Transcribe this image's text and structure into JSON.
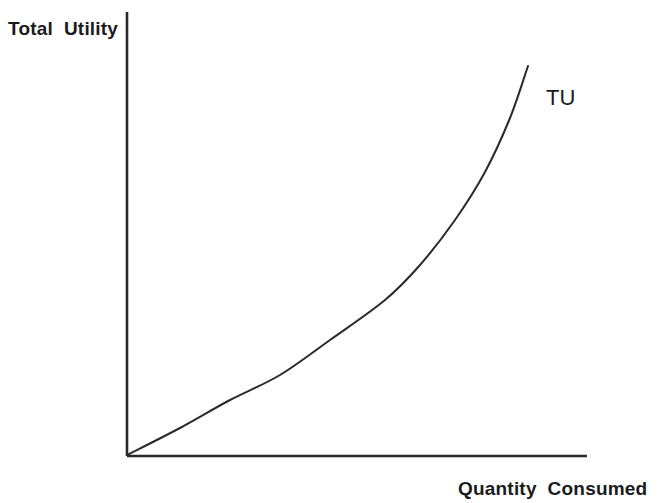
{
  "figure": {
    "background_color": "#ffffff",
    "ink_color": "#2a2a2a"
  },
  "labels": {
    "y_axis": "Total  Utility",
    "x_axis": "Quantity  Consumed",
    "curve": "TU"
  },
  "chart_data": {
    "type": "line",
    "title": "",
    "subtitle": "",
    "xlabel": "Quantity  Consumed",
    "ylabel": "Total  Utility",
    "grid": false,
    "legend": false,
    "legend_position": "inline-right-of-curve",
    "annotations": [
      {
        "text": "TU",
        "x_px": 546,
        "y_px": 87,
        "meaning": "Total Utility curve label"
      }
    ],
    "axes": {
      "x_axis_line_px": {
        "x1": 127,
        "y1": 456,
        "x2": 587,
        "y2": 456
      },
      "y_axis_line_px": {
        "x1": 127,
        "y1": 12,
        "x2": 127,
        "y2": 456
      },
      "origin_px": {
        "x": 127,
        "y": 456
      },
      "ticks_x": [],
      "ticks_y": [],
      "xlim": [
        0,
        1
      ],
      "ylim": [
        0,
        1
      ]
    },
    "series": [
      {
        "name": "TU",
        "description": "Total utility rising at an increasing rate (convex) with quantity consumed",
        "color": "#2a2a2a",
        "line_width_px": 2,
        "x": [
          0.0,
          0.11,
          0.22,
          0.33,
          0.44,
          0.55,
          0.66,
          0.78,
          0.87,
          0.95,
          1.0
        ],
        "y": [
          0.0,
          0.06,
          0.13,
          0.21,
          0.3,
          0.4,
          0.51,
          0.65,
          0.78,
          0.92,
          1.0
        ],
        "points_px": [
          {
            "x": 127,
            "y": 455
          },
          {
            "x": 180,
            "y": 428
          },
          {
            "x": 230,
            "y": 400
          },
          {
            "x": 280,
            "y": 375
          },
          {
            "x": 330,
            "y": 340
          },
          {
            "x": 385,
            "y": 300
          },
          {
            "x": 420,
            "y": 265
          },
          {
            "x": 455,
            "y": 220
          },
          {
            "x": 485,
            "y": 172
          },
          {
            "x": 510,
            "y": 118
          },
          {
            "x": 528,
            "y": 66
          }
        ]
      }
    ]
  }
}
